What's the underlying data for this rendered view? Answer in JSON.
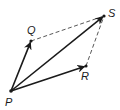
{
  "diagram": {
    "type": "vector-parallelogram",
    "points": [
      {
        "id": "P",
        "label": "P"
      },
      {
        "id": "Q",
        "label": "Q"
      },
      {
        "id": "R",
        "label": "R"
      },
      {
        "id": "S",
        "label": "S"
      }
    ],
    "vectors": [
      {
        "from": "P",
        "to": "Q",
        "style": "solid-arrow"
      },
      {
        "from": "P",
        "to": "S",
        "style": "solid-arrow"
      },
      {
        "from": "P",
        "to": "R",
        "style": "solid-arrow"
      }
    ],
    "segments": [
      {
        "from": "Q",
        "to": "S",
        "style": "dashed"
      },
      {
        "from": "R",
        "to": "S",
        "style": "dashed"
      }
    ]
  }
}
